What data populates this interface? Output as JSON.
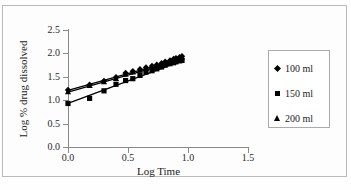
{
  "chart_data": {
    "type": "scatter",
    "title": "",
    "xlabel": "Log Time",
    "ylabel": "Log % drug dissolved",
    "xlim": [
      0.0,
      1.5
    ],
    "ylim": [
      0.0,
      2.5
    ],
    "xticks": [
      "0.0",
      "0.5",
      "1.0",
      "1.5"
    ],
    "xtick_values": [
      0.0,
      0.5,
      1.0,
      1.5
    ],
    "yticks": [
      "0.0",
      "0.5",
      "1.0",
      "1.5",
      "2.0",
      "2.5"
    ],
    "ytick_values": [
      0.0,
      0.5,
      1.0,
      1.5,
      2.0,
      2.5
    ],
    "grid": false,
    "legend_position": "right",
    "series": [
      {
        "name": "100 ml",
        "marker": "diamond",
        "fit_line": {
          "intercept": 1.21,
          "slope": 0.72,
          "x_start": 0.0,
          "x_end": 0.96
        },
        "x": [
          0.0,
          0.18,
          0.3,
          0.4,
          0.48,
          0.54,
          0.6,
          0.65,
          0.7,
          0.74,
          0.78,
          0.81,
          0.85,
          0.88,
          0.9,
          0.93,
          0.95
        ],
        "y": [
          1.22,
          1.33,
          1.41,
          1.49,
          1.58,
          1.62,
          1.66,
          1.7,
          1.73,
          1.76,
          1.79,
          1.82,
          1.85,
          1.88,
          1.9,
          1.92,
          1.94
        ]
      },
      {
        "name": "150 ml",
        "marker": "square",
        "fit_line": {
          "intercept": 0.93,
          "slope": 0.96,
          "x_start": 0.0,
          "x_end": 0.96
        },
        "x": [
          0.0,
          0.18,
          0.3,
          0.4,
          0.48,
          0.54,
          0.6,
          0.65,
          0.7,
          0.74,
          0.78,
          0.81,
          0.85,
          0.88,
          0.9,
          0.93,
          0.95
        ],
        "y": [
          0.93,
          1.04,
          1.2,
          1.34,
          1.42,
          1.46,
          1.53,
          1.6,
          1.63,
          1.67,
          1.71,
          1.75,
          1.78,
          1.8,
          1.82,
          1.84,
          1.85
        ]
      },
      {
        "name": "200 ml",
        "marker": "triangle",
        "fit_line": {
          "intercept": 1.17,
          "slope": 0.73,
          "x_start": 0.0,
          "x_end": 0.96
        },
        "x": [
          0.0,
          0.18,
          0.3,
          0.4,
          0.48,
          0.54,
          0.6,
          0.65,
          0.7,
          0.74,
          0.78,
          0.81,
          0.85,
          0.88,
          0.9,
          0.93,
          0.95
        ],
        "y": [
          1.18,
          1.31,
          1.39,
          1.46,
          1.55,
          1.6,
          1.64,
          1.68,
          1.71,
          1.74,
          1.77,
          1.8,
          1.83,
          1.86,
          1.88,
          1.9,
          1.92
        ]
      }
    ]
  },
  "legend": {
    "items": [
      {
        "label": "100 ml",
        "marker": "diamond-marker-icon"
      },
      {
        "label": "150 ml",
        "marker": "square-marker-icon"
      },
      {
        "label": "200 ml",
        "marker": "triangle-marker-icon"
      }
    ]
  },
  "colors": {
    "series": "#000000",
    "axis": "#8a8a8a",
    "border": "#b9b9b9",
    "background": "#fdfdfd",
    "text": "#1a1a1a"
  }
}
